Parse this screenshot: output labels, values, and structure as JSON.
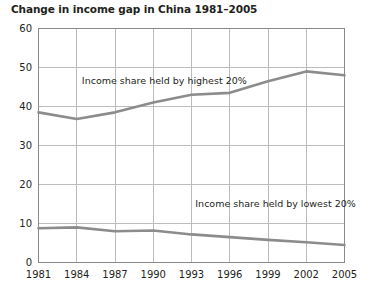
{
  "chart_data": {
    "type": "line",
    "title": "Change in income gap in China 1981–2005",
    "xlabel": "",
    "ylabel": "",
    "x": [
      1981,
      1984,
      1987,
      1990,
      1993,
      1996,
      1999,
      2002,
      2005
    ],
    "categories": [
      "1981",
      "1984",
      "1987",
      "1990",
      "1993",
      "1996",
      "1999",
      "2002",
      "2005"
    ],
    "xlim": [
      1981,
      2005
    ],
    "ylim": [
      0,
      60
    ],
    "yticks": [
      0,
      10,
      20,
      30,
      40,
      50,
      60
    ],
    "ytick_labels": [
      "0",
      "10",
      "20",
      "30",
      "40",
      "50",
      "60"
    ],
    "grid": true,
    "grid_axis": "both",
    "legend": "none",
    "series": [
      {
        "name": "Income share held by highest 20%",
        "values": [
          38.5,
          36.8,
          38.5,
          41.0,
          43.0,
          43.5,
          46.5,
          49.0,
          48.0
        ],
        "color": "#8c8c8c"
      },
      {
        "name": "Income share held by lowest 20%",
        "values": [
          8.8,
          9.0,
          8.0,
          8.2,
          7.2,
          6.5,
          5.8,
          5.2,
          4.5
        ],
        "color": "#8c8c8c"
      }
    ],
    "annotations": [
      {
        "text": "Income share held by highest 20%",
        "x": 1984.4,
        "y": 46.5
      },
      {
        "text": "Income share held by lowest 20%",
        "x": 1993.3,
        "y": 15.0
      }
    ],
    "colors": {
      "line": "#8c8c8c",
      "grid": "#bcbcbc",
      "axis": "#8a8a8a",
      "text": "#231f20",
      "background": "#ffffff"
    }
  }
}
